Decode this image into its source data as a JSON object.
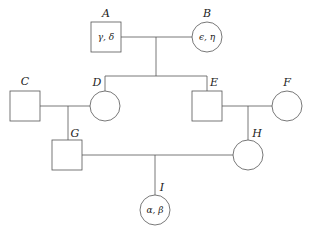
{
  "diagram": {
    "type": "pedigree",
    "colors": {
      "stroke": "#555555",
      "text": "#222222",
      "background": "#ffffff"
    },
    "individuals": [
      {
        "id": "A",
        "label": "A",
        "sex": "male",
        "shape": "square",
        "inner": "γ, δ"
      },
      {
        "id": "B",
        "label": "B",
        "sex": "female",
        "shape": "circle",
        "inner": "ϵ, η"
      },
      {
        "id": "C",
        "label": "C",
        "sex": "male",
        "shape": "square",
        "inner": ""
      },
      {
        "id": "D",
        "label": "D",
        "sex": "female",
        "shape": "circle",
        "inner": ""
      },
      {
        "id": "E",
        "label": "E",
        "sex": "male",
        "shape": "square",
        "inner": ""
      },
      {
        "id": "F",
        "label": "F",
        "sex": "female",
        "shape": "circle",
        "inner": ""
      },
      {
        "id": "G",
        "label": "G",
        "sex": "male",
        "shape": "square",
        "inner": ""
      },
      {
        "id": "H",
        "label": "H",
        "sex": "female",
        "shape": "circle",
        "inner": ""
      },
      {
        "id": "I",
        "label": "I",
        "sex": "female",
        "shape": "circle",
        "inner": "α, β"
      }
    ],
    "matings": [
      {
        "partners": [
          "A",
          "B"
        ],
        "children": [
          "D",
          "E"
        ]
      },
      {
        "partners": [
          "C",
          "D"
        ],
        "children": [
          "G"
        ]
      },
      {
        "partners": [
          "E",
          "F"
        ],
        "children": [
          "H"
        ]
      },
      {
        "partners": [
          "G",
          "H"
        ],
        "children": [
          "I"
        ]
      }
    ]
  }
}
